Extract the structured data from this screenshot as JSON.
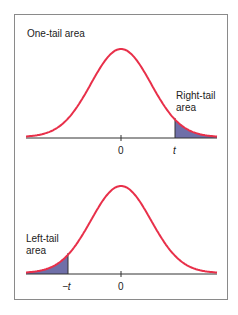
{
  "top_panel": {
    "title": "One-tail area",
    "tail_label_line1": "Right-tail",
    "tail_label_line2": "area",
    "tick_center": "0",
    "tick_t": "t"
  },
  "bottom_panel": {
    "tail_label_line1": "Left-tail",
    "tail_label_line2": "area",
    "tick_neg_t": "−t",
    "tick_center": "0"
  },
  "colors": {
    "curve": "#e8304a",
    "shade": "#6f6fa8",
    "axis": "#333333",
    "frame": "#8a8a8a"
  }
}
